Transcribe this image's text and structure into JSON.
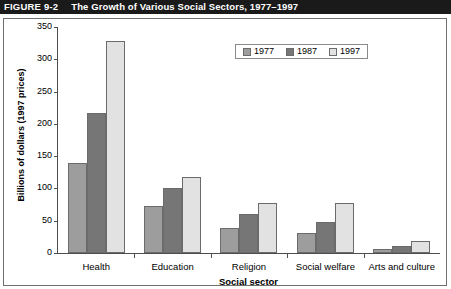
{
  "header": {
    "figure_number": "FIGURE 9-2",
    "title": "The Growth of Various Social Sectors, 1977–1997"
  },
  "chart_data": {
    "type": "bar",
    "title": "The Growth of Various Social Sectors, 1977–1997",
    "xlabel": "Social sector",
    "ylabel": "Billions of dollars (1997 prices)",
    "categories": [
      "Health",
      "Education",
      "Religion",
      "Social welfare",
      "Arts and culture"
    ],
    "series": [
      {
        "name": "1977",
        "color": "#9d9d9d",
        "values": [
          140,
          73,
          38,
          31,
          6
        ]
      },
      {
        "name": "1987",
        "color": "#767676",
        "values": [
          217,
          100,
          61,
          48,
          11
        ]
      },
      {
        "name": "1997",
        "color": "#e2e2e2",
        "values": [
          328,
          118,
          78,
          78,
          18
        ]
      }
    ],
    "ylim": [
      0,
      350
    ],
    "yticks": [
      0,
      50,
      100,
      150,
      200,
      250,
      300,
      350
    ],
    "ytick_labels": [
      "0",
      "50",
      "100",
      "150",
      "200",
      "250",
      "300",
      "350"
    ],
    "grid": false,
    "legend_position": "top-right"
  }
}
